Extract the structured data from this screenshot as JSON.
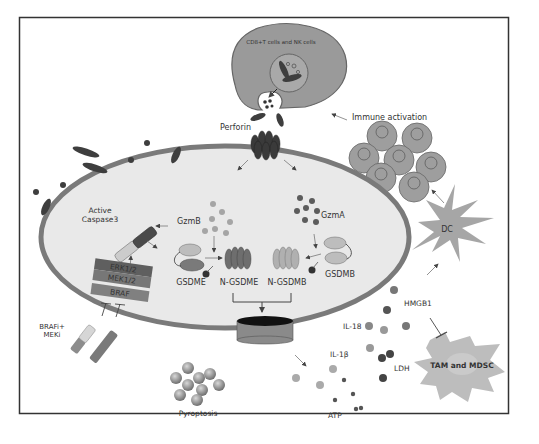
{
  "figure": {
    "colors": {
      "frame": "#333333",
      "cell_fill": "#e9e9e9",
      "membrane": "#7a7a7a",
      "tcell_fill": "#9a9a9a",
      "dark_granule": "#3e3e3e",
      "mid_granule": "#8c8c8c",
      "dc_fill": "#a6a6a6",
      "tam_fill": "#bdbdbd",
      "text": "#333333"
    },
    "labels": {
      "effector_cell": "CD8+T cells and NK cells",
      "perforin": "Perforin",
      "immune_activation": "Immune  activation",
      "gzmb": "GzmB",
      "gzma": "GzmA",
      "active_caspase3_line1": "Active",
      "active_caspase3_line2": "Caspase3",
      "erk": "ERK1/2",
      "mek": "MEK1/2",
      "braf": "BRAF",
      "gsdme": "GSDME",
      "n_gsdme": "N-GSDME",
      "n_gsdmb": "N-GSDMB",
      "gsdmb": "GSDMB",
      "dc": "DC",
      "hmgb1": "HMGB1",
      "il18": "IL-18",
      "il1b": "IL-1β",
      "ldh": "LDH",
      "atp": "ATP",
      "tam_mdsc": "TAM and MDSC",
      "brafi_line1": "BRAFi+",
      "brafi_line2": "MEKi",
      "pyroptosis": "Pyroptosis"
    }
  }
}
